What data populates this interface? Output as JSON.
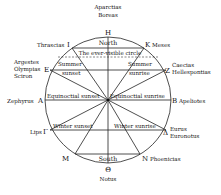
{
  "diagram": {
    "title": "",
    "circle_labels": {
      "north": "North",
      "south": "South",
      "ever_visible": "The ever-visible circle",
      "summer_sunset": [
        "Summer",
        "sunset"
      ],
      "summer_sunrise": [
        "Summer",
        "sunrise"
      ],
      "equinoctial_sunset": "Equinoctial sunset",
      "equinoctial_sunrise": "Equinoctial sunrise",
      "winter_sunset": "Winter sunset",
      "winter_sunrise": "Winter sunrise"
    },
    "winds": {
      "top": {
        "letter": "H",
        "names": [
          "Aparctias",
          "Boreas"
        ]
      },
      "top_left": {
        "letter": "I",
        "names": [
          "Thrascias"
        ]
      },
      "top_right": {
        "letter": "K",
        "names": [
          "Meses"
        ]
      },
      "upper_left": {
        "letter": "E",
        "names": [
          "Argestes",
          "Olympias",
          "Sciron"
        ]
      },
      "upper_right": {
        "letter": "Z",
        "names": [
          "Caecias",
          "Hellespontias"
        ]
      },
      "left": {
        "letter": "A",
        "names": [
          "Zephyrus"
        ]
      },
      "right": {
        "letter": "B",
        "names": [
          "Apeliotes"
        ]
      },
      "lower_left": {
        "letter": "Γ",
        "names": [
          "Lips"
        ]
      },
      "lower_right": {
        "letter": "Δ",
        "names": [
          "Eurus",
          "Euronotus"
        ]
      },
      "bottom_left": {
        "letter": "M",
        "names": []
      },
      "bottom_right": {
        "letter": "N",
        "names": [
          "Phoenicias"
        ]
      },
      "bottom": {
        "letter": "Θ",
        "names": [
          "Notus"
        ]
      }
    }
  }
}
